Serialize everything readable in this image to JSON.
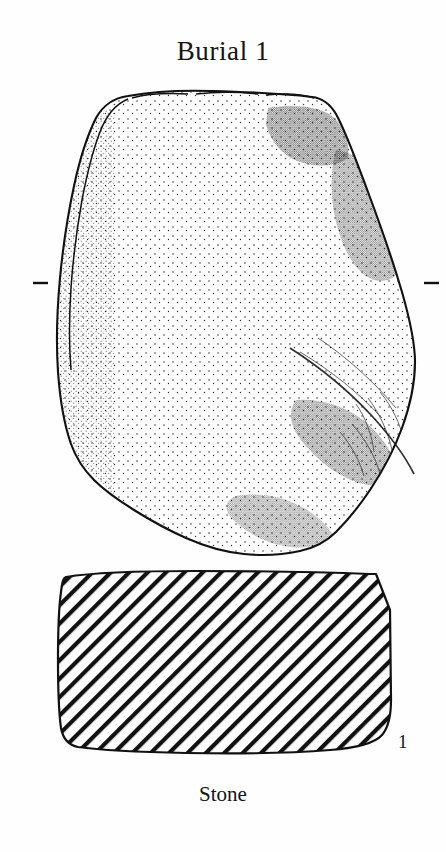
{
  "figure": {
    "title": "Burial 1",
    "material_caption": "Stone",
    "figure_number": "1"
  },
  "views": {
    "plan": {
      "name": "plan-view",
      "description": "stippled plan view of stone slab"
    },
    "section": {
      "name": "cross-section-view",
      "description": "hatched cross-section of stone slab"
    }
  },
  "markers": {
    "left_tick": "section-line-tick-left",
    "right_tick": "section-line-tick-right"
  },
  "colors": {
    "ink": "#111111",
    "paper": "#fefefe",
    "stipple": "#1a1a1a"
  }
}
